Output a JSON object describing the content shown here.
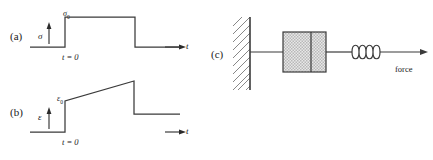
{
  "figure": {
    "width": 433,
    "height": 160,
    "background": "#ffffff",
    "stroke_color": "#3a3a3a",
    "hatch_color": "#6a6a6a"
  },
  "panels": [
    {
      "id": "a",
      "label": "(a)",
      "y_axis_symbol": "σ",
      "y_axis_name": "sigma-stress",
      "x_axis_symbol": "t",
      "x_axis_name": "time",
      "origin_tick_label": "t = 0",
      "level_label": "σ",
      "level_subscript": "0",
      "level_label_name": "sigma-zero",
      "description": "step stress input: zero baseline, instantaneous jump to sigma-zero at t = 0, constant plateau, then instantaneous drop back to zero",
      "chart_type": "step"
    },
    {
      "id": "b",
      "label": "(b)",
      "y_axis_symbol": "ε",
      "y_axis_name": "epsilon-strain",
      "x_axis_symbol": "t",
      "x_axis_name": "time",
      "origin_tick_label": "t = 0",
      "level_label": "ε",
      "level_subscript": "0",
      "level_label_name": "epsilon-zero",
      "description": "creep strain response: zero baseline, instantaneous elastic jump to epsilon-zero at t = 0, linear creep ramp upward, instantaneous elastic recovery drop at unload, then constant permanent residual strain",
      "chart_type": "step-ramp"
    },
    {
      "id": "c",
      "label": "(c)",
      "force_label": "force",
      "components": [
        {
          "name": "fixed-wall",
          "label": ""
        },
        {
          "name": "dashpot",
          "label": ""
        },
        {
          "name": "spring",
          "label": ""
        },
        {
          "name": "force-arrow",
          "label": "force"
        }
      ],
      "description": "Maxwell mechanical model: rigid hatched wall, rod to a shaded dashpot (viscous damper with piston), rod to a coil spring, then force arrow pointing right"
    }
  ]
}
